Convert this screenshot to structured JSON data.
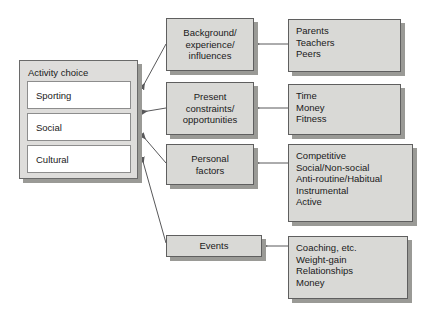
{
  "diagram": {
    "colors": {
      "box_fill": "#d9d9d6",
      "box_border": "#5f5f5f",
      "shadow": "#9a9a96",
      "option_fill": "#ffffff",
      "panel_fill": "#dedddb",
      "connector": "#58585a",
      "text": "#1a1a1a"
    }
  },
  "activity_choice": {
    "title": "Activity choice",
    "options": [
      {
        "label": "Sporting"
      },
      {
        "label": "Social"
      },
      {
        "label": "Cultural"
      }
    ]
  },
  "factor_boxes": [
    {
      "id": "background",
      "text": "Background/\nexperience/\ninfluences"
    },
    {
      "id": "present-constraints",
      "text": "Present\nconstraints/\nopportunities"
    },
    {
      "id": "personal-factors",
      "text": "Personal\nfactors"
    },
    {
      "id": "events",
      "text": "Events"
    }
  ],
  "detail_boxes": [
    {
      "id": "background-details",
      "items": [
        "Parents",
        "Teachers",
        "Peers"
      ]
    },
    {
      "id": "present-constraints-details",
      "items": [
        "Time",
        "Money",
        "Fitness"
      ]
    },
    {
      "id": "personal-factors-details",
      "items": [
        "Competitive",
        "Social/Non-social",
        "Anti-routine/Habitual",
        "Instrumental",
        "Active"
      ]
    },
    {
      "id": "events-details",
      "items": [
        "Coaching, etc.",
        "Weight-gain",
        "Relationships",
        "Money"
      ]
    }
  ],
  "detail_text": {
    "background": "Parents\nTeachers\nPeers",
    "present_constraints": "Time\nMoney\nFitness",
    "personal_factors": "Competitive\nSocial/Non-social\nAnti-routine/Habitual\nInstrumental\nActive",
    "events": "Coaching, etc.\nWeight-gain\nRelationships\nMoney"
  }
}
